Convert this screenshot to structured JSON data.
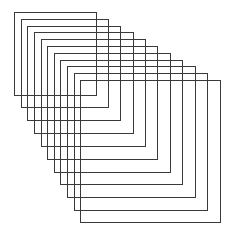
{
  "diagram": {
    "type": "nested-offset-squares",
    "stroke_color": "#3a3a3a",
    "stroke_width": 1,
    "background": "#ffffff",
    "squares": [
      {
        "x": 14,
        "y": 12,
        "w": 82,
        "h": 83
      },
      {
        "x": 21,
        "y": 19,
        "w": 87,
        "h": 88
      },
      {
        "x": 27,
        "y": 26,
        "w": 93,
        "h": 94
      },
      {
        "x": 34,
        "y": 32,
        "w": 99,
        "h": 101
      },
      {
        "x": 41,
        "y": 39,
        "w": 104,
        "h": 107
      },
      {
        "x": 47,
        "y": 46,
        "w": 110,
        "h": 113
      },
      {
        "x": 54,
        "y": 53,
        "w": 116,
        "h": 119
      },
      {
        "x": 60,
        "y": 60,
        "w": 122,
        "h": 124
      },
      {
        "x": 67,
        "y": 66,
        "w": 128,
        "h": 131
      },
      {
        "x": 74,
        "y": 73,
        "w": 133,
        "h": 137
      },
      {
        "x": 80,
        "y": 80,
        "w": 140,
        "h": 142
      }
    ]
  }
}
